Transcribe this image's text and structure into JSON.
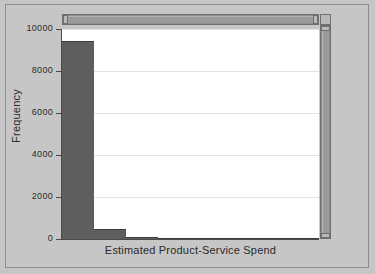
{
  "chart_data": {
    "type": "bar",
    "title": "",
    "subtitle": "",
    "xlabel": "Estimated Product-Service Spend",
    "ylabel": "Frequency",
    "grid": true,
    "legend": null,
    "ylim": [
      0,
      10000
    ],
    "ytick_labels": [
      "0",
      "2000",
      "4000",
      "6000",
      "8000",
      "10000"
    ],
    "ytick_values": [
      0,
      2000,
      4000,
      6000,
      8000,
      10000
    ],
    "xtick_labels": [],
    "bin_count": 8,
    "categories": [
      "bin1",
      "bin2",
      "bin3",
      "bin4",
      "bin5",
      "bin6",
      "bin7",
      "bin8"
    ],
    "values": [
      9450,
      480,
      80,
      20,
      10,
      5,
      5,
      5
    ],
    "bar_color": "#5e5e5e",
    "plot_background": "#ffffff",
    "figure_background": "#c6c6c6",
    "gridline_color": "#e2e2e2",
    "axis_color": "#4a4a4a"
  },
  "chrome": {
    "horizontal_scrollbar": "horizontal-scrollbar",
    "vertical_scrollbar": "vertical-scrollbar",
    "corner": "scrollbar-corner"
  }
}
